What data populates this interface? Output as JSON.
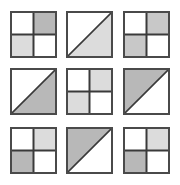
{
  "colors": {
    "white": "#ffffff",
    "light": "#dcdcdc",
    "medium": "#c8c8c8",
    "dark": "#b8b8b8",
    "line": "#3a3a3a"
  },
  "grid": {
    "columns_x": [
      10,
      66,
      123
    ],
    "rows_y": [
      11,
      68,
      127
    ],
    "tile_size": 47
  },
  "tiles": [
    {
      "row": 0,
      "col": 0,
      "type": "quad",
      "tl": "white",
      "tr": "dark",
      "bl": "light",
      "br": "white"
    },
    {
      "row": 0,
      "col": 1,
      "type": "diagonal",
      "fill": "lower-right",
      "shade": "light"
    },
    {
      "row": 0,
      "col": 2,
      "type": "quad",
      "tl": "white",
      "tr": "medium",
      "bl": "medium",
      "br": "white"
    },
    {
      "row": 1,
      "col": 0,
      "type": "diagonal",
      "fill": "lower-right",
      "shade": "dark"
    },
    {
      "row": 1,
      "col": 1,
      "type": "quad",
      "tl": "white",
      "tr": "light",
      "bl": "light",
      "br": "white"
    },
    {
      "row": 1,
      "col": 2,
      "type": "diagonal",
      "fill": "upper-left",
      "shade": "dark"
    },
    {
      "row": 2,
      "col": 0,
      "type": "quad",
      "tl": "white",
      "tr": "light",
      "bl": "dark",
      "br": "white"
    },
    {
      "row": 2,
      "col": 1,
      "type": "diagonal",
      "fill": "upper-left",
      "shade": "dark"
    },
    {
      "row": 2,
      "col": 2,
      "type": "quad",
      "tl": "white",
      "tr": "light",
      "bl": "dark",
      "br": "white"
    }
  ]
}
